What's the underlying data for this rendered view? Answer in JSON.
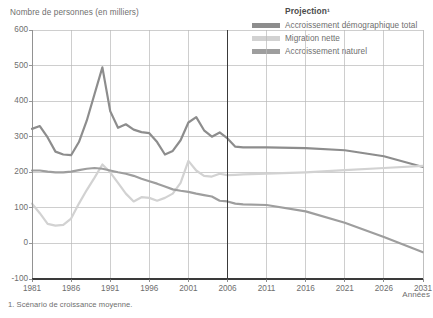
{
  "chart_data": {
    "type": "line",
    "title": "",
    "ylabel": "Nombre de personnes (en milliers)",
    "xlabel": "Années",
    "ylim": [
      -100,
      600
    ],
    "xlim": [
      1981,
      2031
    ],
    "yticks": [
      "600",
      "500",
      "400",
      "300",
      "200",
      "100",
      "0",
      "-100"
    ],
    "xticks": [
      "1981",
      "1986",
      "1991",
      "1996",
      "2001",
      "2006",
      "2011",
      "2016",
      "2021",
      "2026",
      "2031"
    ],
    "grid": true,
    "legend_position": "top-right",
    "legend_title": "Projection¹",
    "projection_start_year": 2006,
    "footnote": "1. Scénario de croissance moyenne.",
    "x": [
      1981,
      1982,
      1983,
      1984,
      1985,
      1986,
      1987,
      1988,
      1989,
      1990,
      1991,
      1992,
      1993,
      1994,
      1995,
      1996,
      1997,
      1998,
      1999,
      2000,
      2001,
      2002,
      2003,
      2004,
      2005,
      2006,
      2007,
      2008,
      2011,
      2016,
      2021,
      2026,
      2031
    ],
    "series": [
      {
        "name": "Accroissement démographique total",
        "color": "#8d8d8d",
        "values": [
          322,
          330,
          298,
          258,
          250,
          248,
          285,
          345,
          420,
          495,
          372,
          325,
          335,
          320,
          313,
          310,
          285,
          250,
          260,
          290,
          340,
          355,
          318,
          300,
          312,
          295,
          272,
          270,
          270,
          268,
          262,
          245,
          215
        ]
      },
      {
        "name": "Migration nette",
        "color": "#d2d2d2",
        "values": [
          112,
          85,
          55,
          50,
          52,
          70,
          112,
          150,
          185,
          222,
          200,
          170,
          140,
          118,
          130,
          128,
          120,
          128,
          140,
          170,
          232,
          205,
          190,
          188,
          196,
          192,
          193,
          194,
          196,
          200,
          206,
          212,
          218
        ]
      },
      {
        "name": "Accroissement naturel",
        "color": "#9e9e9e",
        "values": [
          205,
          205,
          202,
          200,
          200,
          202,
          206,
          210,
          212,
          210,
          205,
          200,
          196,
          190,
          182,
          175,
          168,
          160,
          152,
          148,
          145,
          140,
          136,
          132,
          120,
          118,
          112,
          110,
          108,
          90,
          58,
          18,
          -25
        ]
      }
    ]
  },
  "legend": {
    "title": "Projection¹",
    "items": [
      {
        "label": "Accroissement démographique total",
        "color": "#8d8d8d"
      },
      {
        "label": "Migration nette",
        "color": "#d2d2d2"
      },
      {
        "label": "Accroissement naturel",
        "color": "#9e9e9e"
      }
    ]
  },
  "axes": {
    "y_title": "Nombre de personnes (en milliers)",
    "x_title": "Années",
    "y_ticks": [
      "600",
      "500",
      "400",
      "300",
      "200",
      "100",
      "0",
      "-100"
    ],
    "x_ticks": [
      "1981",
      "1986",
      "1991",
      "1996",
      "2001",
      "2006",
      "2011",
      "2016",
      "2021",
      "2026",
      "2031"
    ]
  },
  "footnote": {
    "text": "1. Scénario de croissance moyenne."
  }
}
